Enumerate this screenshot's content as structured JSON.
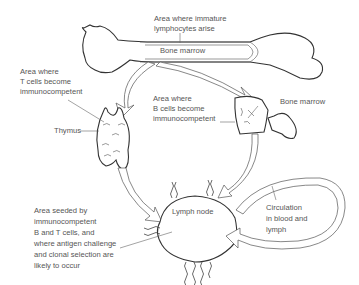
{
  "diagram": {
    "type": "lymphocyte-origin-and-circulation",
    "labels": {
      "immature_area": [
        "Area where immature",
        "lymphocytes arise"
      ],
      "bone_marrow_top": "Bone marrow",
      "t_cell_area": [
        "Area where",
        "T cells become",
        "immunocompetent"
      ],
      "thymus": "Thymus",
      "b_cell_area": [
        "Area where",
        "B cells become",
        "immunocompetent"
      ],
      "bone_marrow_right": "Bone marrow",
      "lymph_node": "Lymph node",
      "seeded_area": [
        "Area seeded by",
        "immunocompetent",
        "B and T cells, and",
        "where antigen challenge",
        "and clonal selection are",
        "likely to occur"
      ],
      "circulation": [
        "Circulation",
        "in blood and",
        "lymph"
      ]
    },
    "nodes": [
      "Bone (long bone with marrow)",
      "Thymus",
      "Bone marrow (joint)",
      "Lymph node"
    ],
    "edges": [
      {
        "from": "Bone marrow",
        "to": "Thymus"
      },
      {
        "from": "Bone marrow",
        "to": "Bone marrow (B cells)"
      },
      {
        "from": "Thymus",
        "to": "Lymph node"
      },
      {
        "from": "Bone marrow (B cells)",
        "to": "Lymph node"
      },
      {
        "from": "Lymph node",
        "to": "Lymph node",
        "via": "Circulation in blood and lymph"
      }
    ],
    "colors": {
      "line": "#333333",
      "text": "#555555",
      "background": "#ffffff"
    }
  }
}
